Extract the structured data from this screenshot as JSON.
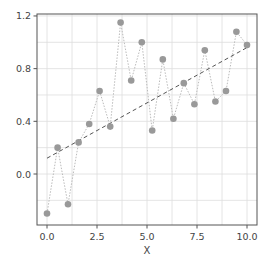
{
  "chart_data": {
    "type": "scatter",
    "title": "",
    "xlabel": "X",
    "ylabel": "",
    "xlim": [
      -0.5,
      10.5
    ],
    "ylim": [
      -0.38,
      1.22
    ],
    "grid": true,
    "legend": null,
    "xticks": [
      0.0,
      2.5,
      5.0,
      7.5,
      10.0
    ],
    "xtick_labels": [
      "0.0",
      "2.5",
      "5.0",
      "7.5",
      "10.0"
    ],
    "yticks": [
      0.0,
      0.4,
      0.8,
      1.2
    ],
    "ytick_labels": [
      "0.0",
      "0.4",
      "0.8",
      "1.2"
    ],
    "series": [
      {
        "name": "data",
        "style": "markers connected by dotted line",
        "color": "#999999",
        "x": [
          0.0,
          0.53,
          1.05,
          1.58,
          2.11,
          2.63,
          3.16,
          3.68,
          4.21,
          4.74,
          5.26,
          5.79,
          6.32,
          6.84,
          7.37,
          7.89,
          8.42,
          8.95,
          9.47,
          10.0
        ],
        "y": [
          -0.3,
          0.2,
          -0.23,
          0.24,
          0.38,
          0.63,
          0.36,
          1.15,
          0.71,
          1.0,
          0.33,
          0.87,
          0.42,
          0.69,
          0.53,
          0.94,
          0.55,
          0.63,
          1.08,
          0.98
        ]
      },
      {
        "name": "trend",
        "style": "dashed line",
        "color": "#555555",
        "x": [
          0.0,
          10.0
        ],
        "y": [
          0.12,
          0.96
        ]
      }
    ]
  },
  "colors": {
    "marker": "#999999",
    "connector": "#bbbbbb",
    "trend": "#555555",
    "grid": "#dddddd",
    "spine": "#555555"
  }
}
